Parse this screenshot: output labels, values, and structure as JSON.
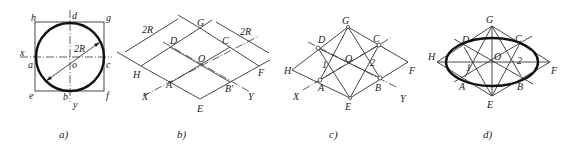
{
  "panels": [
    {
      "id": "a",
      "caption": "a)",
      "labels": {
        "h": "h",
        "d": "d",
        "g": "g",
        "x": "x",
        "a": "a",
        "o": "o",
        "c": "c",
        "e": "e",
        "b": "b",
        "f": "f",
        "y": "y",
        "dim": "2R"
      }
    },
    {
      "id": "b",
      "caption": "b)",
      "labels": {
        "G": "G",
        "D": "D",
        "C": "C",
        "O": "O",
        "H": "H",
        "F": "F",
        "A": "A",
        "B": "B'",
        "X": "X",
        "Y": "Y",
        "E": "E",
        "dim1": "2R",
        "dim2": "2R"
      }
    },
    {
      "id": "c",
      "caption": "c)",
      "labels": {
        "G": "G",
        "D": "D",
        "C": "C",
        "O": "O",
        "H": "H",
        "F": "F",
        "A": "A",
        "B": "B",
        "X": "X",
        "Y": "Y",
        "E": "E",
        "p1": "1",
        "p2": "2"
      }
    },
    {
      "id": "d",
      "caption": "d)",
      "labels": {
        "G": "G",
        "D": "D",
        "C": "C",
        "O": "O",
        "H": "H",
        "F": "F",
        "A": "A",
        "B": "B",
        "E": "E",
        "p1": "1",
        "p2": "2"
      }
    }
  ]
}
